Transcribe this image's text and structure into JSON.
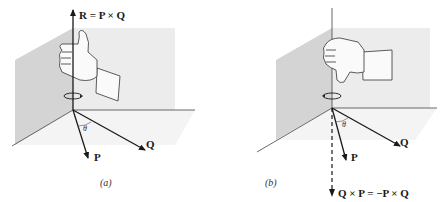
{
  "panels": [
    {
      "id": "a",
      "caption": "(a)",
      "result_label": "R = P × Q",
      "vector_p": "P",
      "vector_q": "Q",
      "angle": "θ",
      "hand": "right-hand thumb up"
    },
    {
      "id": "b",
      "caption": "(b)",
      "result_label": "Q × P = −P × Q",
      "vector_p": "P",
      "vector_q": "Q",
      "angle": "θ",
      "hand": "right-hand thumb down"
    }
  ],
  "colors": {
    "ink": "#1a1a1a",
    "plane_shade": "#d6d6d6",
    "plane_light": "#ececec",
    "floor_shade": "#f0f0f0"
  }
}
